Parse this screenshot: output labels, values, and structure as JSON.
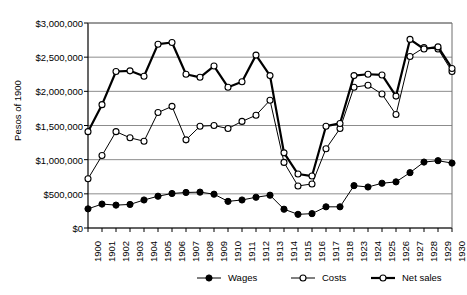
{
  "chart_data": {
    "type": "line",
    "title": "",
    "xlabel": "",
    "ylabel": "Pesos of 1900",
    "ylim": [
      0,
      3000000
    ],
    "ytick_values": [
      0,
      500000,
      1000000,
      1500000,
      2000000,
      2500000,
      3000000
    ],
    "ytick_labels": [
      "$0",
      "$500,000",
      "$1,000,000",
      "$1,500,000",
      "$2,000,000",
      "$2,500,000",
      "$3,000,000"
    ],
    "grid": true,
    "grid_axis": "y",
    "legend_position": "bottom",
    "categories": [
      "1900",
      "1901",
      "1902",
      "1903",
      "1904",
      "1905",
      "1906",
      "1907",
      "1908",
      "1909",
      "1910",
      "1911",
      "1912",
      "1913",
      "1914",
      "1915",
      "1916",
      "1917",
      "1918",
      "1923",
      "1924",
      "1925",
      "1926",
      "1927",
      "1928",
      "1929",
      "1930"
    ],
    "series": [
      {
        "name": "Wages",
        "marker": "filled-circle",
        "line_width": 1,
        "color": "#000000",
        "values": [
          280000,
          350000,
          335000,
          345000,
          410000,
          465000,
          505000,
          520000,
          525000,
          495000,
          390000,
          410000,
          450000,
          480000,
          275000,
          200000,
          210000,
          310000,
          310000,
          620000,
          600000,
          655000,
          675000,
          810000,
          965000,
          985000,
          950000
        ]
      },
      {
        "name": "Costs",
        "marker": "open-circle",
        "line_width": 1,
        "color": "#000000",
        "values": [
          720000,
          1060000,
          1410000,
          1320000,
          1270000,
          1690000,
          1780000,
          1290000,
          1490000,
          1500000,
          1455000,
          1560000,
          1650000,
          1870000,
          960000,
          615000,
          645000,
          1160000,
          1455000,
          2060000,
          2090000,
          1960000,
          1660000,
          2510000,
          2640000,
          2620000,
          2290000
        ]
      },
      {
        "name": "Net sales",
        "marker": "open-circle",
        "line_width": 2.2,
        "color": "#000000",
        "values": [
          1410000,
          1805000,
          2290000,
          2300000,
          2220000,
          2690000,
          2715000,
          2250000,
          2205000,
          2370000,
          2060000,
          2140000,
          2530000,
          2230000,
          1100000,
          790000,
          760000,
          1490000,
          1530000,
          2230000,
          2250000,
          2240000,
          1930000,
          2760000,
          2620000,
          2650000,
          2335000
        ]
      }
    ]
  },
  "axes": {
    "ylabel": "Pesos of 1900"
  },
  "legend": {
    "items": [
      {
        "label": "Wages",
        "marker": "filled-circle"
      },
      {
        "label": "Costs",
        "marker": "open-circle"
      },
      {
        "label": "Net sales",
        "marker": "open-circle"
      }
    ]
  }
}
